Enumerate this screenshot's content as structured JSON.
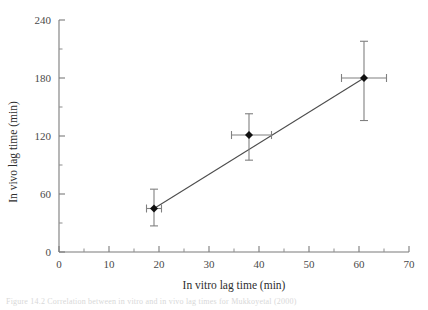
{
  "chart_data": {
    "type": "scatter",
    "title": "",
    "xlabel": "In vitro lag time (min)",
    "ylabel": "In vivo lag time (min)",
    "xlim": [
      0,
      70
    ],
    "ylim": [
      0,
      240
    ],
    "x_major_ticks": [
      0,
      10,
      20,
      30,
      40,
      50,
      60,
      70
    ],
    "y_major_ticks": [
      0,
      60,
      120,
      180,
      240
    ],
    "x_tick_labels": [
      "0",
      "10",
      "20",
      "30",
      "40",
      "50",
      "60",
      "70"
    ],
    "y_tick_labels": [
      "0",
      "60",
      "120",
      "180",
      "240"
    ],
    "x_minor_step": 5,
    "y_minor_step": 30,
    "grid": false,
    "legend": "none",
    "marker": "filled-diamond",
    "series": [
      {
        "name": "in vitro vs in vivo lag time",
        "points": [
          {
            "x": 19,
            "y": 45,
            "x_err_low": 1.5,
            "x_err_high": 1.5,
            "y_err_low": 18,
            "y_err_high": 20
          },
          {
            "x": 38,
            "y": 121,
            "x_err_low": 3.5,
            "x_err_high": 4.5,
            "y_err_low": 26,
            "y_err_high": 22
          },
          {
            "x": 61,
            "y": 180,
            "x_err_low": 4.5,
            "x_err_high": 4.5,
            "y_err_low": 44,
            "y_err_high": 38
          }
        ]
      }
    ],
    "fit_line": {
      "type": "linear",
      "x_start": 19,
      "y_start": 45,
      "x_end": 61,
      "y_end": 180
    }
  },
  "caption": {
    "text": "Figure 14.2  Correlation between in vitro and in vivo lag times for Mukkoyetal (2000)"
  },
  "colors": {
    "axis": "#7b7b7b",
    "marker": "#101010",
    "error_bar": "#808080",
    "fit_line": "#4d4d4d",
    "background": "#ffffff"
  }
}
